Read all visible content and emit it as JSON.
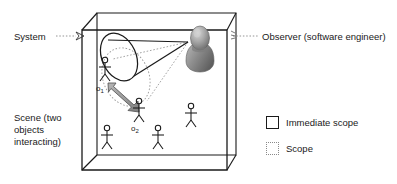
{
  "figure": {
    "callouts": {
      "system": "System",
      "observer": "Observer (software engineer)",
      "scene": "Scene (two objects interacting)"
    },
    "objects": [
      {
        "id": "o1",
        "label": "o",
        "subscript": "1"
      },
      {
        "id": "o2",
        "label": "o",
        "subscript": "2"
      }
    ],
    "legend": [
      {
        "swatch": "solid-square",
        "label": "Immediate scope"
      },
      {
        "swatch": "dotted-square",
        "label": "Scope"
      }
    ],
    "colors": {
      "stroke": "#1a1a1a",
      "dotted": "#8a8a8a",
      "arrow_fill": "#9e9e9e",
      "arrow_stroke": "#4a4a4a",
      "observer_light": "#c8c8c8",
      "observer_mid": "#9a9a9a",
      "observer_dark": "#6e6e6e",
      "background": "#ffffff"
    },
    "shapes": {
      "container": "3d-box",
      "immediate_scope": "solid-cone",
      "scope": "dotted-cone",
      "interaction": "double-headed-arrow",
      "actor_count": 6
    }
  }
}
